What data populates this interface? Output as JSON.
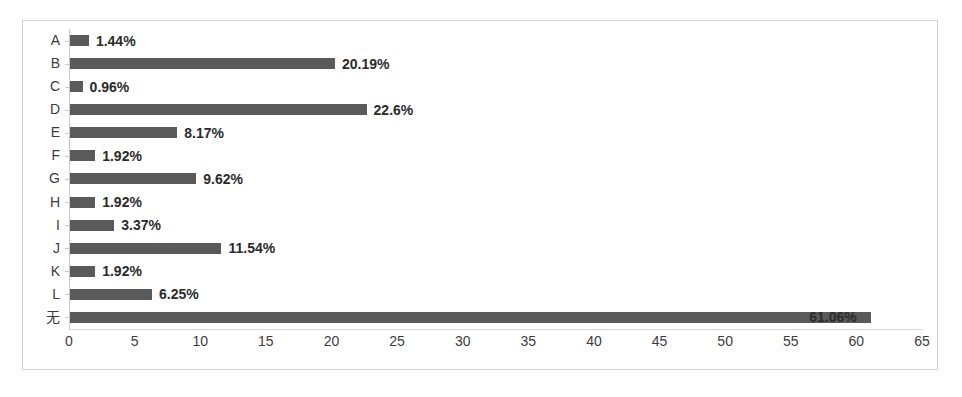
{
  "chart_data": {
    "type": "bar",
    "orientation": "horizontal",
    "title": "",
    "subtitle": "",
    "xlabel": "",
    "ylabel": "",
    "categories": [
      "A",
      "B",
      "C",
      "D",
      "E",
      "F",
      "G",
      "H",
      "I",
      "J",
      "K",
      "L",
      "无"
    ],
    "values": [
      1.44,
      20.19,
      0.96,
      22.6,
      8.17,
      1.92,
      9.62,
      1.92,
      3.37,
      11.54,
      1.92,
      6.25,
      61.06
    ],
    "data_labels": [
      "1.44%",
      "20.19%",
      "0.96%",
      "22.6%",
      "8.17%",
      "1.92%",
      "9.62%",
      "1.92%",
      "3.37%",
      "11.54%",
      "1.92%",
      "6.25%",
      "61.06%"
    ],
    "xlim": [
      0,
      65
    ],
    "xtick_labels": [
      "0",
      "5",
      "10",
      "15",
      "20",
      "25",
      "30",
      "35",
      "40",
      "45",
      "50",
      "55",
      "60",
      "65"
    ],
    "xticks": [
      0,
      5,
      10,
      15,
      20,
      25,
      30,
      35,
      40,
      45,
      50,
      55,
      60,
      65
    ],
    "grid": false,
    "legend": "none",
    "bar_color": "#5a5a5a",
    "label_color": "#2b2b2b",
    "axis_color": "#c8c8c8",
    "border_color": "#d2d2d2",
    "background": "#ffffff"
  }
}
